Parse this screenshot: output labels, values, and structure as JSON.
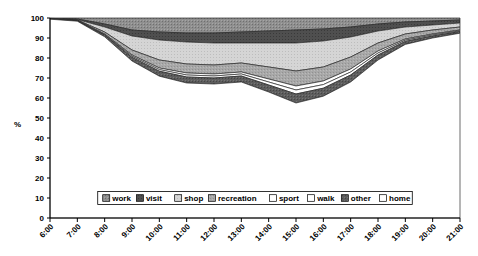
{
  "chart_data": {
    "type": "area",
    "stacked": true,
    "title": "",
    "subtitle": "",
    "xlabel": "",
    "ylabel": "%",
    "ylim": [
      0,
      100
    ],
    "yticks": [
      0,
      10,
      20,
      30,
      40,
      50,
      60,
      70,
      80,
      90,
      100
    ],
    "grid": false,
    "legend_position": "inside-bottom-center",
    "x": [
      "6:00",
      "7:00",
      "8:00",
      "9:00",
      "10:00",
      "11:00",
      "12:00",
      "13:00",
      "14:00",
      "15:00",
      "16:00",
      "17:00",
      "18:00",
      "19:00",
      "20:00",
      "21:00"
    ],
    "categories": [
      "6:00",
      "7:00",
      "8:00",
      "9:00",
      "10:00",
      "11:00",
      "12:00",
      "13:00",
      "14:00",
      "15:00",
      "16:00",
      "17:00",
      "18:00",
      "19:00",
      "20:00",
      "21:00"
    ],
    "stack_order_top_to_bottom": [
      "work",
      "visit",
      "shop",
      "recreation",
      "sport",
      "walk",
      "other",
      "home"
    ],
    "series": [
      {
        "name": "work",
        "swatch": "#8c8c8c",
        "values": [
          0.2,
          0.5,
          3.0,
          6.0,
          7.0,
          7.5,
          7.5,
          7.0,
          6.5,
          6.0,
          5.5,
          4.5,
          3.0,
          2.0,
          1.5,
          1.0
        ]
      },
      {
        "name": "visit",
        "swatch": "#4d4d4d",
        "values": [
          0.1,
          0.3,
          1.5,
          3.0,
          4.0,
          4.5,
          5.0,
          5.5,
          6.0,
          6.5,
          6.0,
          5.0,
          3.5,
          2.5,
          2.0,
          1.5
        ]
      },
      {
        "name": "shop",
        "swatch": "#d9d9d9",
        "values": [
          0.1,
          0.2,
          2.5,
          7.0,
          10.0,
          11.0,
          11.0,
          10.0,
          12.0,
          14.0,
          13.0,
          10.0,
          6.0,
          3.5,
          2.5,
          2.0
        ]
      },
      {
        "name": "recreation",
        "swatch": "#a6a6a6",
        "values": [
          0.1,
          0.2,
          1.0,
          2.5,
          4.0,
          4.5,
          4.5,
          4.5,
          6.0,
          7.5,
          7.0,
          6.0,
          4.0,
          2.5,
          2.0,
          1.5
        ]
      },
      {
        "name": "sport",
        "swatch": "#ffffff",
        "values": [
          0.0,
          0.1,
          0.3,
          0.6,
          0.8,
          1.0,
          1.0,
          1.0,
          1.5,
          2.0,
          1.8,
          1.5,
          1.0,
          0.6,
          0.5,
          0.4
        ]
      },
      {
        "name": "walk",
        "swatch": "#ffffff",
        "values": [
          0.0,
          0.1,
          0.3,
          0.6,
          0.8,
          1.0,
          1.0,
          1.0,
          1.5,
          2.0,
          1.8,
          1.5,
          1.0,
          0.6,
          0.5,
          0.4
        ]
      },
      {
        "name": "other",
        "swatch": "#595959",
        "values": [
          0.1,
          0.2,
          0.8,
          1.8,
          2.5,
          3.0,
          3.0,
          3.0,
          3.5,
          4.5,
          4.0,
          3.5,
          2.5,
          1.5,
          1.0,
          0.8
        ]
      },
      {
        "name": "home",
        "swatch": "#ffffff",
        "values": [
          99.4,
          98.4,
          90.6,
          78.5,
          70.9,
          67.5,
          67.0,
          68.0,
          63.0,
          57.5,
          60.9,
          68.0,
          79.0,
          86.8,
          90.0,
          92.4
        ]
      }
    ],
    "cumulative_top_boundaries": {
      "note": "Upper boundary of each band as stacked percent, top band first",
      "work": [
        99.8,
        99.5,
        97.0,
        94.0,
        93.0,
        92.5,
        92.5,
        93.0,
        93.5,
        94.0,
        94.5,
        95.5,
        97.0,
        98.0,
        98.5,
        99.0
      ],
      "visit": [
        99.7,
        99.2,
        95.5,
        91.0,
        89.0,
        88.0,
        87.5,
        87.5,
        87.5,
        87.5,
        88.5,
        90.5,
        93.5,
        95.5,
        96.5,
        97.5
      ],
      "shop": [
        99.6,
        99.0,
        93.0,
        84.0,
        79.0,
        77.0,
        76.5,
        77.5,
        75.5,
        73.5,
        75.5,
        80.5,
        87.5,
        92.0,
        94.0,
        95.5
      ],
      "recreation": [
        99.5,
        98.8,
        91.8,
        81.5,
        75.0,
        72.5,
        72.0,
        73.0,
        69.5,
        66.0,
        68.5,
        74.5,
        83.5,
        89.5,
        92.0,
        94.0
      ],
      "sport": [
        99.5,
        98.7,
        91.5,
        80.9,
        74.1,
        71.5,
        71.0,
        72.0,
        68.0,
        64.0,
        66.7,
        73.0,
        82.5,
        88.9,
        91.5,
        93.6
      ],
      "walk": [
        99.5,
        98.6,
        91.4,
        80.3,
        73.4,
        70.5,
        70.0,
        71.0,
        66.5,
        62.0,
        64.9,
        71.5,
        81.5,
        88.3,
        91.0,
        93.2
      ],
      "other": [
        99.4,
        98.4,
        90.6,
        78.5,
        70.9,
        67.5,
        67.0,
        68.0,
        63.0,
        57.5,
        60.9,
        68.0,
        79.0,
        86.8,
        90.0,
        92.4
      ]
    },
    "min_home_value": 57.5,
    "min_home_time": "15:00"
  },
  "axes": {
    "y_label": "%",
    "y_ticks": [
      "0",
      "10",
      "20",
      "30",
      "40",
      "50",
      "60",
      "70",
      "80",
      "90",
      "100"
    ],
    "x_ticks": [
      "6:00",
      "7:00",
      "8:00",
      "9:00",
      "10:00",
      "11:00",
      "12:00",
      "13:00",
      "14:00",
      "15:00",
      "16:00",
      "17:00",
      "18:00",
      "19:00",
      "20:00",
      "21:00"
    ]
  },
  "legend": {
    "items": [
      {
        "label": "work"
      },
      {
        "label": "visit"
      },
      {
        "label": "shop"
      },
      {
        "label": "recreation"
      },
      {
        "label": "sport"
      },
      {
        "label": "walk"
      },
      {
        "label": "other"
      },
      {
        "label": "home"
      }
    ]
  }
}
